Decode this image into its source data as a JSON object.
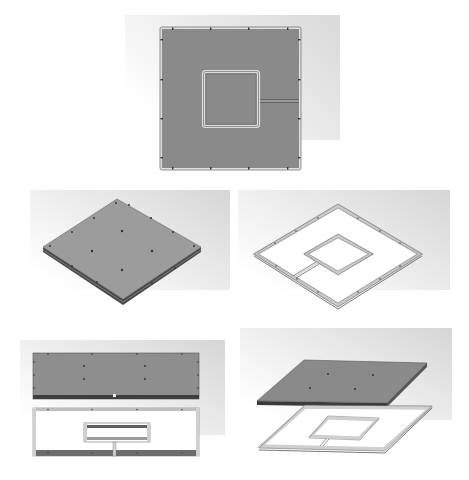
{
  "caption": {
    "text": "",
    "note": "partially cropped caption line at top edge (illegible)"
  },
  "colors": {
    "background": "#ffffff",
    "render_bg_dark": "#dedede",
    "render_bg_light": "#ffffff",
    "plate_fill": "#8c8c8c",
    "plate_fill_iso": "#9a9a9a",
    "plate_edge": "#555555",
    "frame_fill": "#ffffff",
    "frame_rail": "#d4d4d4",
    "frame_edge": "#6a6a6a",
    "bolt": "#3a3a3a"
  },
  "views": [
    {
      "id": "top-view",
      "label": "Top view of assembled panel (plate with inner square frame and slot)",
      "region": {
        "x": 120,
        "y": 12,
        "w": 230,
        "h": 165
      }
    },
    {
      "id": "iso-plate",
      "label": "Isometric view of assembled cover plate with bolt holes",
      "region": {
        "x": 20,
        "y": 185,
        "w": 215,
        "h": 125
      }
    },
    {
      "id": "iso-frame",
      "label": "Isometric view of frame (outer rail, inner square, connecting channel)",
      "region": {
        "x": 235,
        "y": 185,
        "w": 225,
        "h": 125
      }
    },
    {
      "id": "exploded-front",
      "label": "Front exploded view: cover plate above frame",
      "region": {
        "x": 15,
        "y": 335,
        "w": 215,
        "h": 130
      }
    },
    {
      "id": "exploded-iso",
      "label": "Isometric exploded view: cover plate above frame",
      "region": {
        "x": 235,
        "y": 325,
        "w": 225,
        "h": 140
      }
    }
  ]
}
